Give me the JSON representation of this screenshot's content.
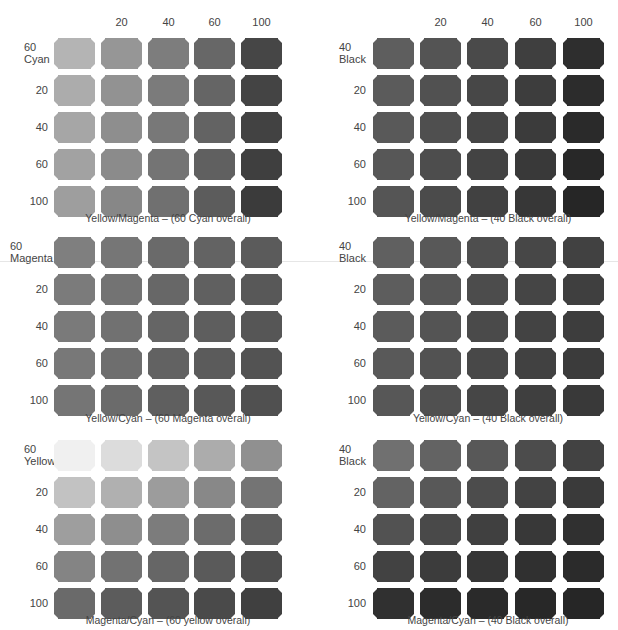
{
  "chart_data": [
    {
      "type": "heatmap",
      "title": "Yellow/Magenta – (60 Cyan overall)",
      "corner_label": [
        "60",
        "Cyan"
      ],
      "column_labels": [
        "",
        "20",
        "40",
        "60",
        "100"
      ],
      "row_labels": [
        "60 Cyan",
        "20",
        "40",
        "60",
        "100"
      ],
      "x_axis": "Yellow",
      "y_axis": "Magenta",
      "overall": "60 Cyan",
      "colors": [
        [
          "#b4b4b4",
          "#969696",
          "#7d7d7d",
          "#676767",
          "#464646"
        ],
        [
          "#acacac",
          "#929292",
          "#7b7b7b",
          "#656565",
          "#444444"
        ],
        [
          "#a6a6a6",
          "#8e8e8e",
          "#787878",
          "#636363",
          "#424242"
        ],
        [
          "#a2a2a2",
          "#8b8b8b",
          "#747474",
          "#606060",
          "#3f3f3f"
        ],
        [
          "#9e9e9e",
          "#878787",
          "#707070",
          "#5c5c5c",
          "#3b3b3b"
        ]
      ]
    },
    {
      "type": "heatmap",
      "title": "Yellow/Magenta – (40 Black overall)",
      "corner_label": [
        "40",
        "Black"
      ],
      "column_labels": [
        "",
        "20",
        "40",
        "60",
        "100"
      ],
      "row_labels": [
        "40 Black",
        "20",
        "40",
        "60",
        "100"
      ],
      "x_axis": "Yellow",
      "y_axis": "Magenta",
      "overall": "40 Black",
      "colors": [
        [
          "#5e5e5e",
          "#545454",
          "#4a4a4a",
          "#3f3f3f",
          "#2e2e2e"
        ],
        [
          "#5b5b5b",
          "#515151",
          "#474747",
          "#3d3d3d",
          "#2c2c2c"
        ],
        [
          "#595959",
          "#4f4f4f",
          "#454545",
          "#3b3b3b",
          "#2a2a2a"
        ],
        [
          "#575757",
          "#4d4d4d",
          "#434343",
          "#393939",
          "#282828"
        ],
        [
          "#555555",
          "#4b4b4b",
          "#414141",
          "#373737",
          "#262626"
        ]
      ]
    },
    {
      "type": "heatmap",
      "title": "Yellow/Cyan – (60 Magenta overall)",
      "corner_label": [
        "60",
        "Magenta"
      ],
      "column_labels": [
        "",
        "20",
        "40",
        "60",
        "100"
      ],
      "row_labels": [
        "60 Magenta",
        "20",
        "40",
        "60",
        "100"
      ],
      "x_axis": "Yellow",
      "y_axis": "Cyan",
      "overall": "60 Magenta",
      "colors": [
        [
          "#7f7f7f",
          "#767676",
          "#6a6a6a",
          "#636363",
          "#5b5b5b"
        ],
        [
          "#7b7b7b",
          "#737373",
          "#676767",
          "#606060",
          "#585858"
        ],
        [
          "#7a7a7a",
          "#717171",
          "#656565",
          "#5e5e5e",
          "#565656"
        ],
        [
          "#787878",
          "#6e6e6e",
          "#626262",
          "#5b5b5b",
          "#535353"
        ],
        [
          "#757575",
          "#6b6b6b",
          "#5f5f5f",
          "#585858",
          "#505050"
        ]
      ]
    },
    {
      "type": "heatmap",
      "title": "Yellow/Cyan – (40 Black overall)",
      "corner_label": [
        "40",
        "Black"
      ],
      "column_labels": [
        "",
        "20",
        "40",
        "60",
        "100"
      ],
      "row_labels": [
        "40 Black",
        "20",
        "40",
        "60",
        "100"
      ],
      "x_axis": "Yellow",
      "y_axis": "Cyan",
      "overall": "40 Black",
      "colors": [
        [
          "#606060",
          "#585858",
          "#4e4e4e",
          "#474747",
          "#414141"
        ],
        [
          "#5d5d5d",
          "#565656",
          "#4c4c4c",
          "#454545",
          "#3f3f3f"
        ],
        [
          "#5b5b5b",
          "#545454",
          "#4a4a4a",
          "#434343",
          "#3d3d3d"
        ],
        [
          "#595959",
          "#525252",
          "#484848",
          "#414141",
          "#3b3b3b"
        ],
        [
          "#575757",
          "#505050",
          "#464646",
          "#3f3f3f",
          "#393939"
        ]
      ]
    },
    {
      "type": "heatmap",
      "title": "Magenta/Cyan – (60 yellow overall)",
      "corner_label": [
        "60",
        "Yellow"
      ],
      "column_labels": [
        "",
        "20",
        "40",
        "60",
        "100"
      ],
      "row_labels": [
        "60 Yellow",
        "20",
        "40",
        "60",
        "100"
      ],
      "x_axis": "Magenta",
      "y_axis": "Cyan",
      "overall": "60 yellow",
      "colors": [
        [
          "#f0f0f0",
          "#dcdcdc",
          "#c4c4c4",
          "#acacac",
          "#909090"
        ],
        [
          "#c2c2c2",
          "#b0b0b0",
          "#9c9c9c",
          "#888888",
          "#747474"
        ],
        [
          "#9e9e9e",
          "#8e8e8e",
          "#7c7c7c",
          "#6c6c6c",
          "#5e5e5e"
        ],
        [
          "#848484",
          "#727272",
          "#666666",
          "#5a5a5a",
          "#4e4e4e"
        ],
        [
          "#6a6a6a",
          "#5c5c5c",
          "#545454",
          "#4a4a4a",
          "#404040"
        ]
      ]
    },
    {
      "type": "heatmap",
      "title": "Magenta/Cyan – (40 Black overall)",
      "corner_label": [
        "40",
        "Black"
      ],
      "column_labels": [
        "",
        "20",
        "40",
        "60",
        "100"
      ],
      "row_labels": [
        "40 Black",
        "20",
        "40",
        "60",
        "100"
      ],
      "x_axis": "Magenta",
      "y_axis": "Cyan",
      "overall": "40 Black",
      "colors": [
        [
          "#707070",
          "#636363",
          "#585858",
          "#4c4c4c",
          "#424242"
        ],
        [
          "#636363",
          "#585858",
          "#4c4c4c",
          "#434343",
          "#3a3a3a"
        ],
        [
          "#525252",
          "#494949",
          "#404040",
          "#383838",
          "#303030"
        ],
        [
          "#424242",
          "#3c3c3c",
          "#363636",
          "#303030",
          "#2b2b2b"
        ],
        [
          "#303030",
          "#2c2c2c",
          "#2a2a2a",
          "#282828",
          "#262626"
        ]
      ]
    }
  ],
  "column_headers": [
    "20",
    "40",
    "60",
    "100"
  ],
  "row_values": [
    "20",
    "40",
    "60",
    "100"
  ],
  "panels": [
    {
      "corner_top": "60",
      "corner_bottom": "Cyan",
      "caption": "Yellow/Magenta – (60 Cyan overall)"
    },
    {
      "corner_top": "40",
      "corner_bottom": "Black",
      "caption": "Yellow/Magenta – (40 Black overall)"
    },
    {
      "corner_top": "60",
      "corner_bottom": "Magenta",
      "caption": "Yellow/Cyan – (60 Magenta overall)"
    },
    {
      "corner_top": "40",
      "corner_bottom": "Black",
      "caption": "Yellow/Cyan – (40 Black overall)"
    },
    {
      "corner_top": "60",
      "corner_bottom": "Yellow",
      "caption": "Magenta/Cyan – (60 yellow overall)"
    },
    {
      "corner_top": "40",
      "corner_bottom": "Black",
      "caption": "Magenta/Cyan – (40 Black overall)"
    }
  ]
}
